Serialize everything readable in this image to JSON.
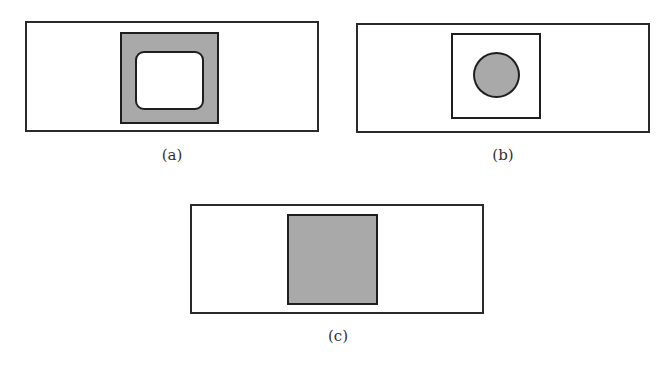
{
  "figure": {
    "panels": [
      {
        "id": "a",
        "label": "(a)",
        "description": "Rectangle containing a gray square with a white rounded-rectangle cutout",
        "fill_color": "#a9a9a9"
      },
      {
        "id": "b",
        "label": "(b)",
        "description": "Rectangle containing a white square with a gray filled circle",
        "fill_color": "#a9a9a9"
      },
      {
        "id": "c",
        "label": "(c)",
        "description": "Rectangle containing a solid gray square",
        "fill_color": "#a9a9a9"
      }
    ],
    "caption": ""
  }
}
